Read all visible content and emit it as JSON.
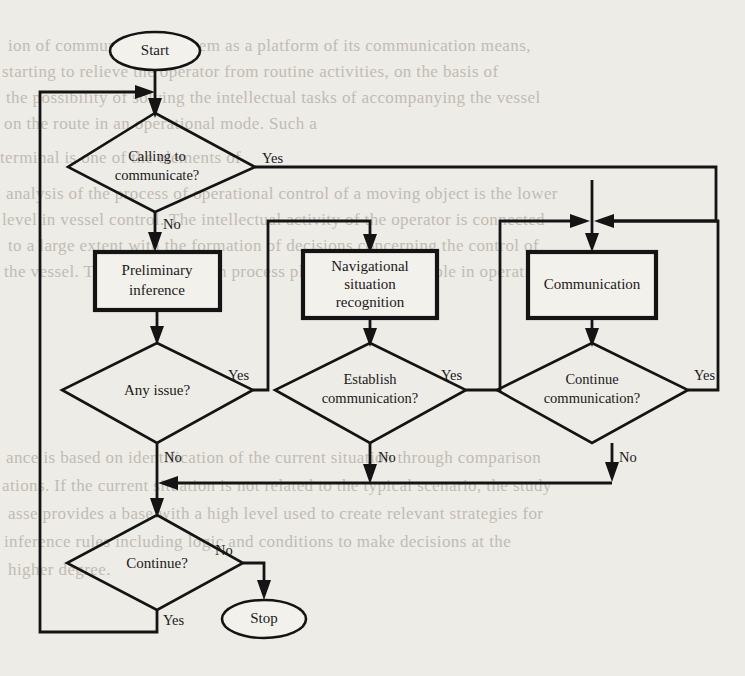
{
  "diagram": {
    "background_color": "#eeece6",
    "ink_color": "#141414",
    "nodes": {
      "start": {
        "label": "Start",
        "type": "terminator"
      },
      "calling": {
        "label_line1": "Calling to",
        "label_line2": "communicate?",
        "type": "decision"
      },
      "preliminary": {
        "label_line1": "Preliminary",
        "label_line2": "inference",
        "type": "process"
      },
      "navigational": {
        "label_line1": "Navigational",
        "label_line2": "situation",
        "label_line3": "recognition",
        "type": "process"
      },
      "communication": {
        "label_line1": "Communication",
        "type": "process"
      },
      "any_issue": {
        "label_line1": "Any issue?",
        "type": "decision"
      },
      "establish": {
        "label_line1": "Establish",
        "label_line2": "communication?",
        "type": "decision"
      },
      "continue_comm": {
        "label_line1": "Continue",
        "label_line2": "communication?",
        "type": "decision"
      },
      "continue": {
        "label_line1": "Continue?",
        "type": "decision"
      },
      "stop": {
        "label": "Stop",
        "type": "terminator"
      }
    },
    "edge_labels": {
      "calling_yes": "Yes",
      "calling_no": "No",
      "any_issue_yes": "Yes",
      "any_issue_no": "No",
      "establish_yes": "Yes",
      "establish_no": "No",
      "continue_comm_yes": "Yes",
      "continue_comm_no": "No",
      "continue_no": "No",
      "continue_yes": "Yes"
    }
  },
  "page_bleed": {
    "lines": [
      "ion of communication system as a platform of its communication means,",
      "starting to relieve the operator from routine activities, on the basis of",
      "the possibility of solving the intellectual tasks of accompanying the vessel",
      "on the route in an operational mode. Such a",
      "terminal is one of the elements of",
      "analysis of the process of operational control of a moving object is the lower",
      "level in vessel control. The intellectual activity of the operator is connected",
      "to a large extent with the formation of decisions concerning the control of",
      "the vessel. The communication process plays an important role in operation.",
      "ance is based on identification of the current situation through comparison",
      "ations. If the current situation is not related to the typical scenario, the study",
      "asse provides a base with a high level used to create relevant strategies for",
      "inference rules including logic and conditions to make decisions at the",
      "higher degree."
    ]
  }
}
